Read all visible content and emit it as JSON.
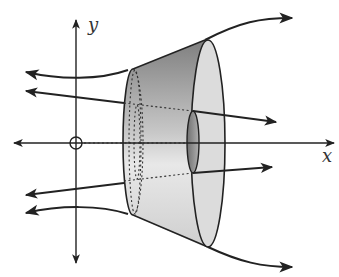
{
  "diagram": {
    "type": "solid-of-revolution",
    "axes": {
      "x_label": "x",
      "y_label": "y"
    },
    "colors": {
      "stroke": "#222222",
      "surface_dark": "#8a8a8a",
      "surface_light": "#e6e6e6",
      "face": "#d9d9d9",
      "hole": "#9a9a9a"
    }
  }
}
